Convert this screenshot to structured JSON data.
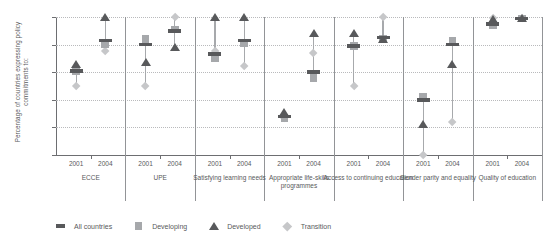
{
  "chart_data": {
    "type": "scatter",
    "title": "",
    "xlabel": "",
    "ylabel": "Percentage of countries expressing policy commitments to:",
    "ylim": [
      0,
      100
    ],
    "yticks": [
      0,
      20,
      40,
      60,
      80,
      100
    ],
    "grid": true,
    "legend_position": "bottom-left",
    "legend": [
      {
        "name": "All countries",
        "marker": "bar",
        "color": "#58595b"
      },
      {
        "name": "Developing",
        "marker": "square",
        "color": "#a6a8ab"
      },
      {
        "name": "Developed",
        "marker": "triangle",
        "color": "#58595b"
      },
      {
        "name": "Transition",
        "marker": "diamond",
        "color": "#c6c7c9"
      }
    ],
    "series_order": [
      "All countries",
      "Developing",
      "Developed",
      "Transition"
    ],
    "categories": [
      {
        "label": "ECCE",
        "years": [
          {
            "year": "2001",
            "values": {
              "All countries": 61,
              "Developing": 61,
              "Developed": 66,
              "Transition": 50
            }
          },
          {
            "year": "2004",
            "values": {
              "All countries": 83,
              "Developing": 80,
              "Developed": 100,
              "Transition": 75
            }
          }
        ]
      },
      {
        "label": "UPE",
        "years": [
          {
            "year": "2001",
            "values": {
              "All countries": 80,
              "Developing": 84,
              "Developed": 67,
              "Transition": 50
            }
          },
          {
            "year": "2004",
            "values": {
              "All countries": 90,
              "Developing": 91,
              "Developed": 78,
              "Transition": 100
            }
          }
        ]
      },
      {
        "label": "Satisfying learning needs",
        "years": [
          {
            "year": "2001",
            "values": {
              "All countries": 73,
              "Developing": 70,
              "Developed": 100,
              "Transition": 75
            }
          },
          {
            "year": "2004",
            "values": {
              "All countries": 83,
              "Developing": 81,
              "Developed": 100,
              "Transition": 64
            }
          }
        ]
      },
      {
        "label": "Appropriate life-skills programmes",
        "years": [
          {
            "year": "2001",
            "values": {
              "All countries": 28,
              "Developing": 27,
              "Developed": 31,
              "Transition": 27
            }
          },
          {
            "year": "2004",
            "values": {
              "All countries": 60,
              "Developing": 56,
              "Developed": 88,
              "Transition": 74
            }
          }
        ]
      },
      {
        "label": "Access to continuing education",
        "years": [
          {
            "year": "2001",
            "values": {
              "All countries": 79,
              "Developing": 79,
              "Developed": 88,
              "Transition": 50
            }
          },
          {
            "year": "2004",
            "values": {
              "All countries": 85,
              "Developing": 84,
              "Developed": 84,
              "Transition": 100
            }
          }
        ]
      },
      {
        "label": "Gender parity and equality",
        "years": [
          {
            "year": "2001",
            "values": {
              "All countries": 40,
              "Developing": 42,
              "Developed": 22,
              "Transition": 0
            }
          },
          {
            "year": "2004",
            "values": {
              "All countries": 80,
              "Developing": 83,
              "Developed": 66,
              "Transition": 24
            }
          }
        ]
      },
      {
        "label": "Quality of education",
        "years": [
          {
            "year": "2001",
            "values": {
              "All countries": 95,
              "Developing": 94,
              "Developed": 98,
              "Transition": 99
            }
          },
          {
            "year": "2004",
            "values": {
              "All countries": 99,
              "Developing": 99,
              "Developed": 99,
              "Transition": 99
            }
          }
        ]
      }
    ]
  }
}
